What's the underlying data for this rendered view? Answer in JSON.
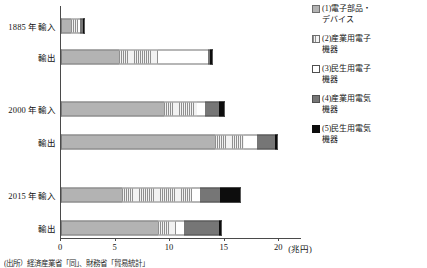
{
  "chart_data": {
    "type": "bar",
    "orientation": "horizontal",
    "stacked": true,
    "title": "",
    "xlabel": "",
    "ylabel": "",
    "unit_label": "(兆円)",
    "xlim": [
      0,
      22
    ],
    "xticks": [
      0,
      5,
      10,
      15,
      20
    ],
    "xtick_labels": [
      "0",
      "5",
      "10",
      "15",
      "20"
    ],
    "grid": false,
    "legend_position": "right",
    "categories": [
      "1885 年輸入",
      "輸出",
      "2000 年輸入",
      "輸出",
      "2015 年輸入",
      "輸出"
    ],
    "series": [
      {
        "name": "(1)電子部品・\nデバイス",
        "pattern": "solid-gray",
        "values": [
          0.9,
          5.3,
          9.4,
          14.1,
          5.6,
          8.9
        ]
      },
      {
        "name": "(2)産業用電子\n機器",
        "pattern": "vertical-stripes",
        "values": [
          0.7,
          3.6,
          3.1,
          2.7,
          6.4,
          1.6
        ]
      },
      {
        "name": "(3)民生用電子\n機器",
        "pattern": "white-outline",
        "values": [
          0.1,
          4.6,
          0.7,
          1.2,
          0.7,
          0.8
        ]
      },
      {
        "name": "(4)産業用電気\n機器",
        "pattern": "dark-gray",
        "values": [
          0.35,
          0.15,
          1.3,
          1.6,
          1.9,
          3.2
        ]
      },
      {
        "name": "(5)民生用電気\n機器",
        "pattern": "black",
        "values": [
          0.15,
          0.3,
          0.5,
          0.3,
          1.9,
          0.3
        ]
      }
    ],
    "totals": [
      2.2,
      13.95,
      15.0,
      19.9,
      16.5,
      14.8
    ]
  },
  "legend": {
    "items": [
      {
        "label": "(1)電子部品・\nデバイス",
        "swatch": "legend-swatch-solid-gray"
      },
      {
        "label": "(2)産業用電子\n機器",
        "swatch": "legend-swatch-striped"
      },
      {
        "label": "(3)民生用電子\n機器",
        "swatch": "legend-swatch-white"
      },
      {
        "label": "(4)産業用電気\n機器",
        "swatch": "legend-swatch-dark-gray"
      },
      {
        "label": "(5)民生用電気\n機器",
        "swatch": "legend-swatch-black"
      }
    ]
  },
  "source": {
    "note": "(出所）経済産業省「同」、財務省「貿易統計」"
  }
}
